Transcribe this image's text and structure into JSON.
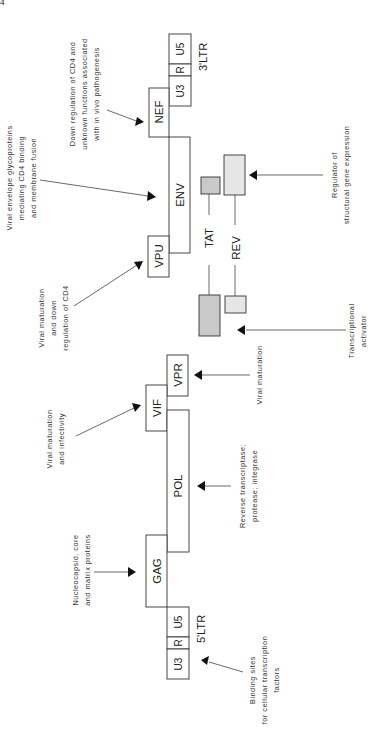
{
  "page": {
    "number": "4"
  },
  "diagram": {
    "orientation": "rotated-90-ccw",
    "genes": [
      {
        "id": "ltr3-u5",
        "label": "U5",
        "group": "3'LTR"
      },
      {
        "id": "ltr3-r",
        "label": "R",
        "group": "3'LTR"
      },
      {
        "id": "ltr3-u3",
        "label": "U3",
        "group": "3'LTR"
      },
      {
        "id": "nef",
        "label": "NEF"
      },
      {
        "id": "env",
        "label": "ENV"
      },
      {
        "id": "vpu",
        "label": "VPU"
      },
      {
        "id": "vpr",
        "label": "VPR"
      },
      {
        "id": "vif",
        "label": "VIF"
      },
      {
        "id": "pol",
        "label": "POL"
      },
      {
        "id": "gag",
        "label": "GAG"
      },
      {
        "id": "ltr5-u5",
        "label": "U5",
        "group": "5'LTR"
      },
      {
        "id": "ltr5-r",
        "label": "R",
        "group": "5'LTR"
      },
      {
        "id": "ltr5-u3",
        "label": "U3",
        "group": "5'LTR"
      },
      {
        "id": "tat",
        "label": "TAT"
      },
      {
        "id": "rev",
        "label": "REV"
      }
    ],
    "ltr_labels": {
      "three_prime": "3'LTR",
      "five_prime": "5'LTR"
    },
    "annotations": {
      "nef": [
        "Down regulation of CD4 and",
        "unknown functions associated",
        "with in vivo pathogenesis"
      ],
      "env": [
        "Viral envelope glycoproteins",
        "mediating CD4 binding",
        "and membrane fusion"
      ],
      "rev": [
        "Regulator of",
        "structural gene expression"
      ],
      "vpu": [
        "Viral maturation",
        "and down",
        "regulation of CD4"
      ],
      "tat": [
        "Transcriptional",
        "activator"
      ],
      "vpr": [
        "Viral maturation"
      ],
      "vif": [
        "Viral maturation",
        "and infectivity"
      ],
      "pol": [
        "Reverse transcriptase;",
        "protease; integrase"
      ],
      "gag": [
        "Nucleocapsid, core",
        "and matrix proteins"
      ],
      "ltr5": [
        "Binding sites",
        "for cellular transcription",
        "factors"
      ]
    },
    "colors": {
      "stroke": "#333333",
      "tat_fill": "#c9c9c9",
      "rev_fill": "#e6e6e6",
      "background": "#ffffff"
    }
  }
}
